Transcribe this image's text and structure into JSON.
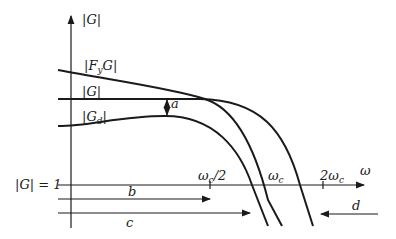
{
  "diagram": {
    "type": "bode-magnitude-sketch",
    "axes": {
      "y_label": "|G|",
      "x_label": "ω",
      "unity_label": "|G| = 1"
    },
    "curves": [
      {
        "name": "FyG",
        "label_main": "|F",
        "label_sub": "y",
        "label_end": "G|"
      },
      {
        "name": "G",
        "label_main": "|G|"
      },
      {
        "name": "Gd",
        "label_main": "|G",
        "label_sub": "d",
        "label_end": "|"
      }
    ],
    "ticks": [
      {
        "label_main": "ω",
        "label_sub": "c",
        "label_end": "/2"
      },
      {
        "label_main": "ω",
        "label_sub": "c",
        "label_end": ""
      },
      {
        "label_main": "2ω",
        "label_sub": "c",
        "label_end": ""
      }
    ],
    "annotations": {
      "a": "a",
      "b": "b",
      "c": "c",
      "d": "d"
    }
  }
}
